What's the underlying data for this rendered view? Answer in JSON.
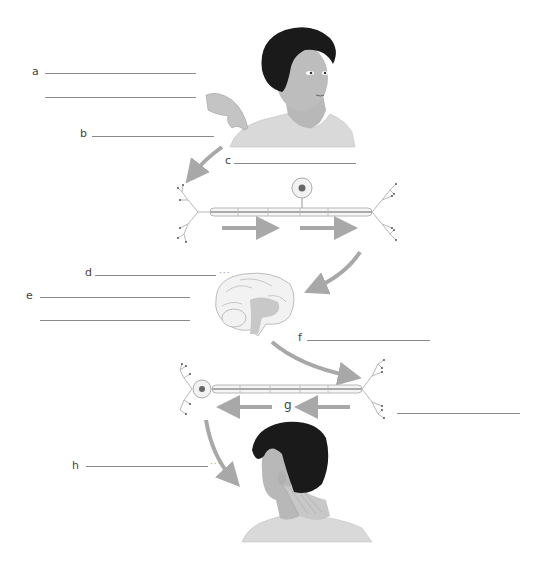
{
  "diagram": {
    "type": "reflex/nerve-pathway worksheet (fill in the blanks)",
    "colors": {
      "hair": "#1a1a1a",
      "skin": "#bdbdbd",
      "shirt": "#d9d9d9",
      "arrow": "#a8a8a8",
      "blank_line": "#8a8a8a",
      "brain_fill": "#f0f0f0",
      "brain_inner": "#c8c8c8",
      "neuron": "#cfcfcf"
    },
    "labels": {
      "a": "a",
      "b": "b",
      "c": "c",
      "d": "d",
      "e": "e",
      "f": "f",
      "g": "g",
      "h": "h"
    },
    "blanks": {
      "a1": "",
      "a2": "",
      "b": "",
      "c": "",
      "d": "",
      "e1": "",
      "e2": "",
      "f": "",
      "g": "",
      "h": ""
    },
    "leader_dots": "···",
    "figures": [
      {
        "id": "person-touched",
        "desc": "person being touched on shoulder by a hand"
      },
      {
        "id": "sensory-neuron",
        "desc": "sensory neuron, impulse arrows pointing right"
      },
      {
        "id": "brain",
        "desc": "sagittal section of brain"
      },
      {
        "id": "motor-neuron",
        "desc": "motor neuron, impulse arrows pointing left"
      },
      {
        "id": "person-turning",
        "desc": "person turning head, neck muscles shown"
      }
    ]
  }
}
